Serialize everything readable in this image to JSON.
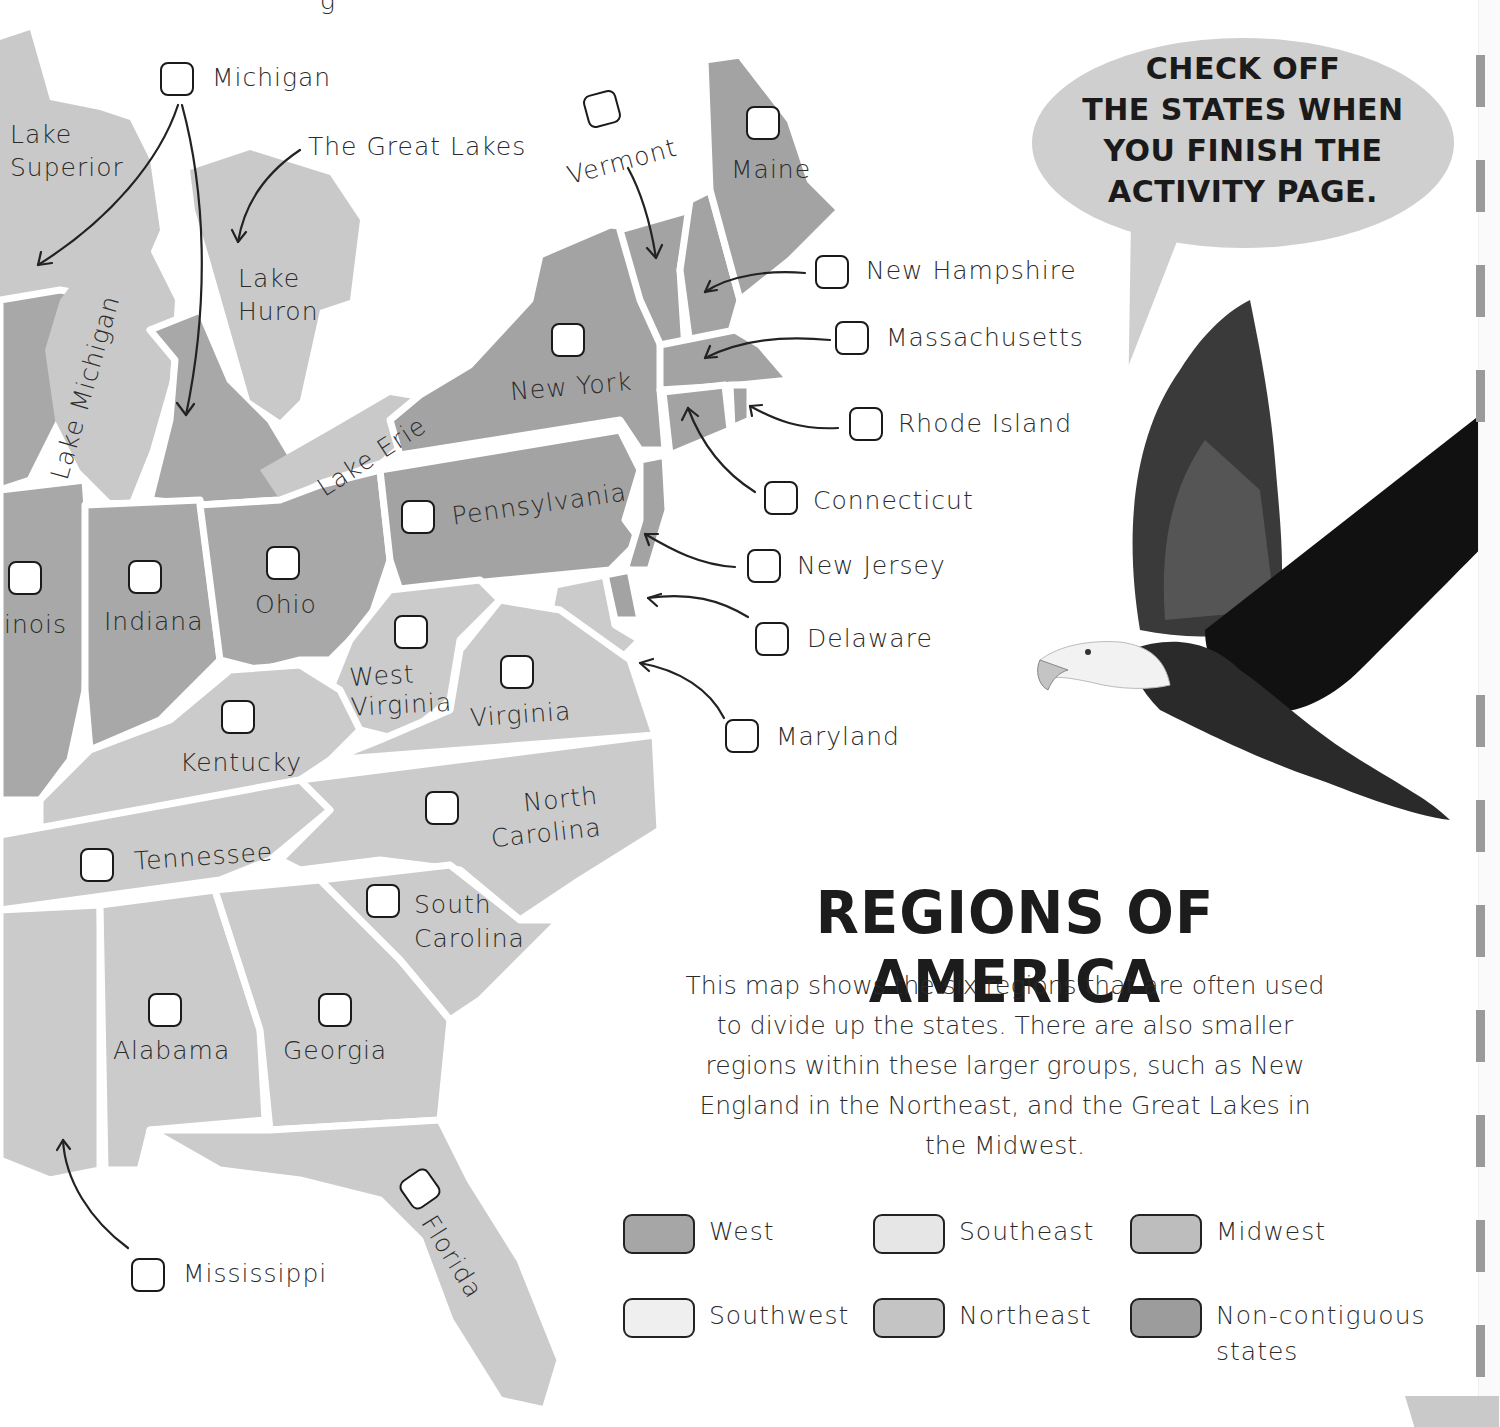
{
  "header": {
    "partial_top_text": "g"
  },
  "speech_bubble": {
    "lines": [
      "CHECK OFF",
      "THE STATES WHEN",
      "YOU FINISH THE",
      "ACTIVITY PAGE."
    ]
  },
  "map_labels": {
    "lake_superior": "Lake Superior",
    "lake_michigan": "Lake Michigan",
    "lake_huron": "Lake Huron",
    "lake_erie": "Lake Erie",
    "great_lakes": "The Great Lakes"
  },
  "states": [
    {
      "id": "michigan",
      "name": "Michigan"
    },
    {
      "id": "vermont",
      "name": "Vermont"
    },
    {
      "id": "maine",
      "name": "Maine"
    },
    {
      "id": "new-hampshire",
      "name": "New Hampshire"
    },
    {
      "id": "massachusetts",
      "name": "Massachusetts"
    },
    {
      "id": "new-york",
      "name": "New York"
    },
    {
      "id": "rhode-island",
      "name": "Rhode Island"
    },
    {
      "id": "connecticut",
      "name": "Connecticut"
    },
    {
      "id": "pennsylvania",
      "name": "Pennsylvania"
    },
    {
      "id": "new-jersey",
      "name": "New Jersey"
    },
    {
      "id": "delaware",
      "name": "Delaware"
    },
    {
      "id": "maryland",
      "name": "Maryland"
    },
    {
      "id": "illinois",
      "name": "inois"
    },
    {
      "id": "indiana",
      "name": "Indiana"
    },
    {
      "id": "ohio",
      "name": "Ohio"
    },
    {
      "id": "west-virginia",
      "name": "West Virginia"
    },
    {
      "id": "virginia",
      "name": "Virginia"
    },
    {
      "id": "kentucky",
      "name": "Kentucky"
    },
    {
      "id": "north-carolina",
      "name": "North Carolina"
    },
    {
      "id": "tennessee",
      "name": "Tennessee"
    },
    {
      "id": "south-carolina",
      "name": "South Carolina"
    },
    {
      "id": "alabama",
      "name": "Alabama"
    },
    {
      "id": "georgia",
      "name": "Georgia"
    },
    {
      "id": "florida",
      "name": "Florida"
    },
    {
      "id": "mississippi",
      "name": "Mississippi"
    }
  ],
  "section": {
    "title": "REGIONS OF AMERICA",
    "description": "This map shows the six regions that are often used to divide up the states. There are also smaller regions within these larger groups, such as New England in the Northeast, and the Great Lakes in the Midwest."
  },
  "legend": [
    {
      "label": "West",
      "color": "#a6a6a6"
    },
    {
      "label": "Southeast",
      "color": "#e6e6e6"
    },
    {
      "label": "Midwest",
      "color": "#bdbdbd"
    },
    {
      "label": "Southwest",
      "color": "#efefef"
    },
    {
      "label": "Northeast",
      "color": "#c4c4c4"
    },
    {
      "label": "Non-contiguous states",
      "color": "#9c9c9c"
    }
  ]
}
